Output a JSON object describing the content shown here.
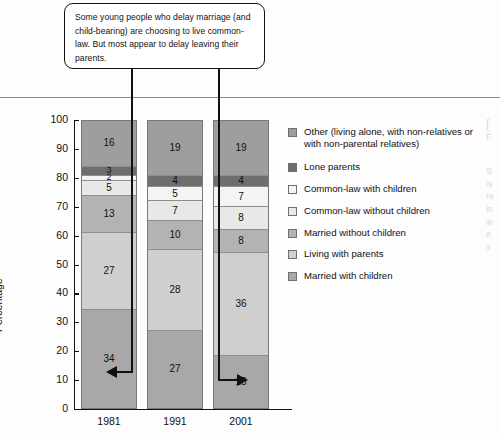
{
  "callout": {
    "text": "Some young people who delay marriage (and child-bearing) are choosing to live common-law. But most appear to delay leaving their parents."
  },
  "chart_data": {
    "type": "bar",
    "stacked": true,
    "title": "",
    "xlabel": "",
    "ylabel": "Percentage",
    "ylim": [
      0,
      100
    ],
    "ytick_step": 10,
    "ytick_labels": [
      "100",
      "90",
      "80",
      "70",
      "60",
      "50",
      "40",
      "30",
      "20",
      "10",
      "0"
    ],
    "grid": false,
    "legend_position": "right",
    "categories": [
      "1981",
      "1991",
      "2001"
    ],
    "series": [
      {
        "name": "Married with children",
        "values": [
          34,
          27,
          18
        ],
        "color": "#a8a8a8"
      },
      {
        "name": "Living with parents",
        "values": [
          27,
          28,
          36
        ],
        "color": "#cfcfcf"
      },
      {
        "name": "Married without children",
        "values": [
          13,
          10,
          8
        ],
        "color": "#b3b3b3"
      },
      {
        "name": "Common-law without children",
        "values": [
          5,
          7,
          8
        ],
        "color": "#e8e8e8"
      },
      {
        "name": "Common-law with children",
        "values": [
          2,
          5,
          7
        ],
        "color": "#f4f4f4"
      },
      {
        "name": "Lone parents",
        "values": [
          3,
          4,
          4
        ],
        "color": "#6e6e6e"
      },
      {
        "name": "Other (living alone, with non-relatives or with non-parental relatives)",
        "values": [
          16,
          19,
          19
        ],
        "color": "#9e9e9e"
      }
    ]
  },
  "legend": {
    "items": [
      {
        "label": "Other (living alone, with non-relatives or with non-parental relatives)",
        "color": "#9e9e9e"
      },
      {
        "label": "Lone parents",
        "color": "#6e6e6e"
      },
      {
        "label": "Common-law with children",
        "color": "#f4f4f4"
      },
      {
        "label": "Common-law without children",
        "color": "#e8e8e8"
      },
      {
        "label": "Married without children",
        "color": "#b3b3b3"
      },
      {
        "label": "Living with parents",
        "color": "#cfcfcf"
      },
      {
        "label": "Married with children",
        "color": "#a8a8a8"
      }
    ]
  },
  "right_column": {
    "bracket": "[",
    "lines": [
      "F",
      "S",
      "is",
      "re",
      "in",
      "w",
      "e",
      "s"
    ]
  }
}
